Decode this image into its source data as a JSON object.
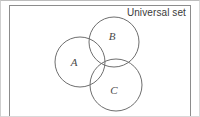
{
  "figure": {
    "title_label": "Universal set",
    "kind": "venn-diagram",
    "set_count": 3
  },
  "colors": {
    "background": "#ffffff",
    "circle_stroke": "#6e6e6e",
    "box_stroke": "#8c8c8c",
    "outer_frame": "#d9d9d9",
    "label_text": "#3a3a3a",
    "set_label_text": "#4a4a4a"
  },
  "universal_box": {
    "x": 9,
    "y": 5,
    "width": 182,
    "height": 118
  },
  "sets": [
    {
      "id": "A",
      "label": "A",
      "cx": 80,
      "cy": 62,
      "r": 25,
      "label_x": 74,
      "label_y": 66
    },
    {
      "id": "B",
      "label": "B",
      "cx": 114,
      "cy": 42,
      "r": 25,
      "label_x": 112,
      "label_y": 40
    },
    {
      "id": "C",
      "label": "C",
      "cx": 116,
      "cy": 85,
      "r": 26,
      "label_x": 114,
      "label_y": 94
    }
  ]
}
